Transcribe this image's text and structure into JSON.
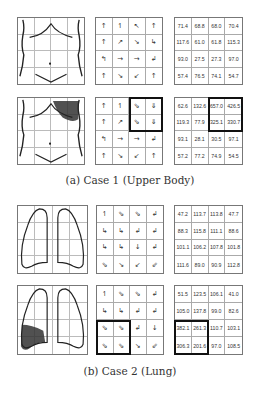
{
  "figure": {
    "cases": [
      {
        "caption": "(a) Case 1 (Upper Body)",
        "rows": [
          {
            "body_image": "upper-body-outline",
            "flow_glyphs": [
              "↑",
              "↿",
              "↖",
              "↑",
              "↑",
              "↗",
              "↘",
              "↳",
              "↰",
              "→",
              "→",
              "↲",
              "↑",
              "↘",
              "↙",
              "↑"
            ],
            "values": [
              "71.4",
              "68.8",
              "68.0",
              "70.4",
              "117.6",
              "61.0",
              "61.8",
              "115.3",
              "93.0",
              "27.5",
              "27.3",
              "97.0",
              "57.4",
              "76.5",
              "74.1",
              "54.7"
            ],
            "highlight": null
          },
          {
            "body_image": "upper-body-outline-with-shaded-right-shoulder",
            "flow_glyphs": [
              "↑",
              "↿",
              "⇘",
              "⇓",
              "↑",
              "↗",
              "⇘",
              "⇓",
              "↰",
              "→",
              "→",
              "↲",
              "↑",
              "↘",
              "↙",
              "↑"
            ],
            "values": [
              "62.6",
              "132.6",
              "657.0",
              "426.5",
              "119.3",
              "77.9",
              "325.1",
              "330.7",
              "93.1",
              "28.1",
              "30.5",
              "97.1",
              "57.2",
              "77.2",
              "74.9",
              "54.5"
            ],
            "highlight": "top-right-2x2"
          }
        ]
      },
      {
        "caption": "(b) Case 2 (Lung)",
        "rows": [
          {
            "body_image": "lung-outline",
            "flow_glyphs": [
              "↿",
              "⇘",
              "⇘",
              "↲",
              "↳",
              "↳",
              "↲",
              "↲",
              "↳",
              "↳",
              "↓",
              "↲",
              "⇘",
              "↘",
              "↙",
              "⇙"
            ],
            "values": [
              "47.2",
              "113.7",
              "113.8",
              "47.7",
              "88.3",
              "115.8",
              "111.1",
              "88.6",
              "101.1",
              "106.2",
              "107.8",
              "101.8",
              "111.6",
              "89.0",
              "90.9",
              "112.8"
            ],
            "highlight": null
          },
          {
            "body_image": "lung-outline-with-shaded-left-lower-lobe",
            "flow_glyphs": [
              "↿",
              "⇘",
              "⇘",
              "↲",
              "↳",
              "↳",
              "↲",
              "↲",
              "⇘",
              "⇘",
              "↲",
              "↓",
              "⇘",
              "⇘",
              "↘",
              "⇙"
            ],
            "values": [
              "51.5",
              "123.5",
              "106.1",
              "41.0",
              "105.0",
              "137.8",
              "99.0",
              "82.6",
              "382.1",
              "261.3",
              "110.7",
              "103.1",
              "306.3",
              "201.6",
              "97.0",
              "108.5"
            ],
            "highlight": "bottom-left-2x2"
          }
        ]
      }
    ]
  }
}
